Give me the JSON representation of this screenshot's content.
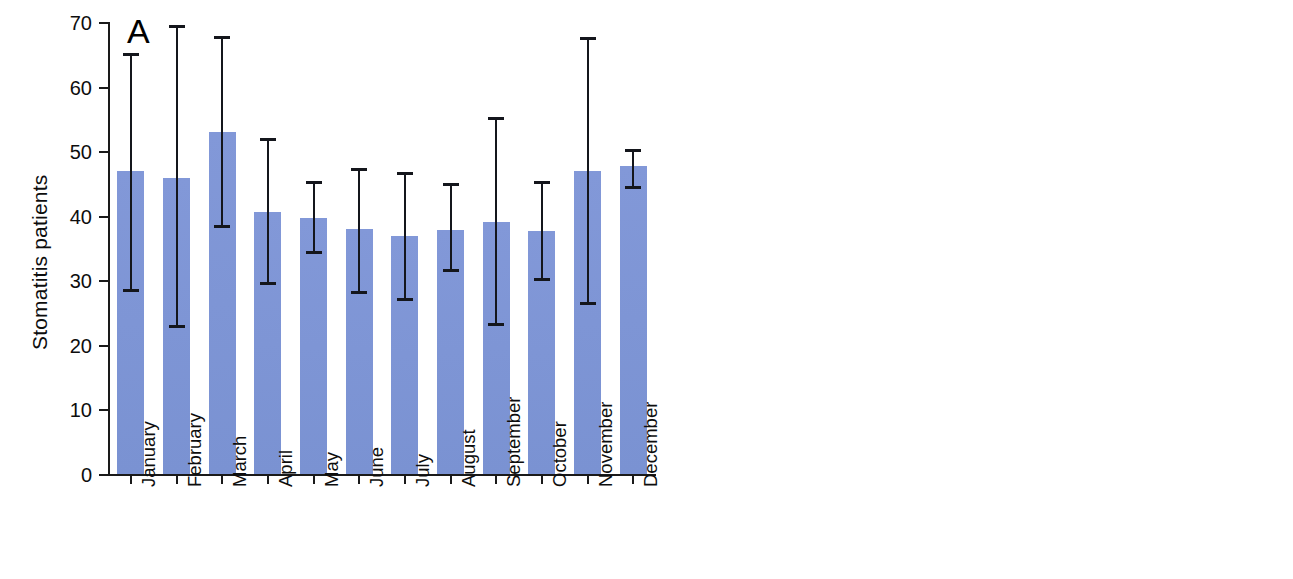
{
  "figure": {
    "panels": [
      {
        "letter": "A",
        "ylabel": "Stomatitis patients"
      },
      {
        "letter": "B",
        "ylabel": "Kampo-prescribed stomatitis patients"
      }
    ],
    "bar_color": "#7d96d6",
    "error_color": "#14161c",
    "axis_color": "#1a1a1a"
  },
  "chart_data": [
    {
      "type": "bar",
      "panel": "A",
      "title": "A",
      "xlabel": "",
      "ylabel": "Stomatitis patients",
      "ylim": [
        0,
        70
      ],
      "yticks": [
        0,
        10,
        20,
        30,
        40,
        50,
        60,
        70
      ],
      "ytick_labels": [
        "0",
        "10",
        "20",
        "30",
        "40",
        "50",
        "60",
        "70"
      ],
      "grid": false,
      "legend": "none",
      "categories": [
        "January",
        "February",
        "March",
        "April",
        "May",
        "June",
        "July",
        "August",
        "September",
        "October",
        "November",
        "December"
      ],
      "values": [
        46.9,
        45.9,
        52.9,
        40.5,
        39.7,
        37.9,
        36.9,
        37.8,
        39.1,
        37.7,
        46.9,
        47.7
      ],
      "error_upper": [
        65.2,
        69.5,
        67.8,
        52.1,
        45.4,
        47.4,
        46.7,
        45.1,
        55.3,
        45.4,
        67.7,
        50.3
      ],
      "error_lower": [
        28.4,
        22.8,
        38.3,
        29.4,
        34.2,
        28.1,
        26.9,
        31.4,
        23.1,
        30.1,
        26.3,
        44.3
      ],
      "error_type": "range"
    },
    {
      "type": "bar",
      "panel": "B",
      "title": "B",
      "xlabel": "",
      "ylabel": "Kampo-prescribed stomatitis patients",
      "ylim": [
        0,
        14
      ],
      "yticks": [
        0,
        2,
        4,
        6,
        8,
        10,
        12,
        14
      ],
      "ytick_labels": [
        "0",
        "2",
        "4",
        "6",
        "8",
        "10",
        "12",
        "14"
      ],
      "grid": false,
      "legend": "none",
      "categories": [
        "January",
        "February",
        "March",
        "April",
        "May",
        "June",
        "July",
        "August",
        "September",
        "October",
        "November",
        "December"
      ],
      "values": [
        4,
        8,
        8,
        12,
        11,
        9,
        8,
        6,
        10,
        8,
        7,
        4
      ]
    }
  ]
}
